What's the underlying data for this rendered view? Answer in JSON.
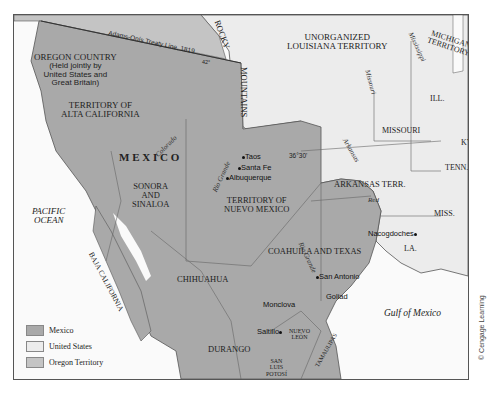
{
  "map": {
    "colors": {
      "mexico": "#a9a9a9",
      "united_states": "#ececec",
      "oregon_territory": "#c4c4c4",
      "water": "#fafafa",
      "border": "#555555"
    },
    "regions": {
      "oregon_country": [
        "OREGON COUNTRY",
        "(Held jointly by",
        "United States and",
        "Great Britain)"
      ],
      "alta_california": [
        "TERRITORY OF",
        "ALTA CALIFORNIA"
      ],
      "mexico": "M E X I C O",
      "sonora": [
        "SONORA",
        "AND",
        "SINALOA"
      ],
      "baja": "BAJA CALIFORNIA",
      "nuevo_mexico": [
        "TERRITORY OF",
        "NUEVO MEXICO"
      ],
      "chihuahua": "CHIHUAHUA",
      "coahuila_texas": "COAHUILA AND TEXAS",
      "durango": "DURANGO",
      "nuevo_leon": [
        "NUEVO",
        "LEÓN"
      ],
      "san_luis_potosi": [
        "SAN",
        "LUIS",
        "POTOSÍ"
      ],
      "tamaulipas": "TAMAULIPAS",
      "unorganized_louisiana": [
        "UNORGANIZED",
        "LOUISIANA TERRITORY"
      ],
      "michigan": [
        "MICHIGAN",
        "TERRITORY"
      ],
      "illinois": "ILL.",
      "missouri": "MISSOURI",
      "kentucky": "KY.",
      "tennessee": "TENN.",
      "arkansas": "ARKANSAS TERR.",
      "mississippi": "MISS.",
      "louisiana": "LA."
    },
    "features": {
      "rocky": "ROCKY",
      "mountains": "MOUNTAINS",
      "treaty_line": "Adams-Onís Treaty Line, 1819",
      "parallel_42": "42°",
      "parallel_36": "36°30'",
      "pacific": [
        "PACIFIC",
        "OCEAN"
      ],
      "gulf": "Gulf of Mexico"
    },
    "rivers": {
      "colorado": "Colorado",
      "rio_grande_north": "Rio Grande",
      "rio_grande_south": "Rio Grande",
      "missouri": "Missouri",
      "mississippi": "Mississippi",
      "arkansas": "Arkansas",
      "red": "Red"
    },
    "cities": {
      "taos": "Taos",
      "santa_fe": "Santa Fe",
      "albuquerque": "Albuquerque",
      "nacogdoches": "Nacogdoches",
      "san_antonio": "San Antonio",
      "goliad": "Goliad",
      "monclova": "Monclova",
      "saltillo": "Saltillo"
    },
    "legend": [
      {
        "label": "Mexico",
        "color": "#a9a9a9"
      },
      {
        "label": "United States",
        "color": "#ececec"
      },
      {
        "label": "Oregon Territory",
        "color": "#c4c4c4"
      }
    ],
    "credit": "© Cengage Learning"
  }
}
